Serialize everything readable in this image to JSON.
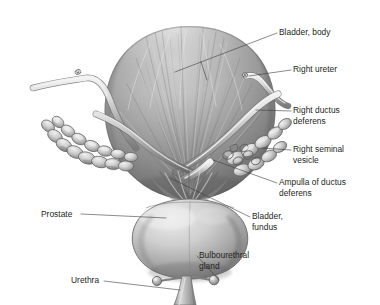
{
  "figure": {
    "background_color": "#ffffff",
    "label_color": "#231f20",
    "leader_color": "#3c3c3c"
  },
  "labels": [
    {
      "id": "bladder-body",
      "lines": [
        "Bladder, body"
      ],
      "x": 279,
      "y": 35,
      "anchor": "start"
    },
    {
      "id": "right-ureter",
      "lines": [
        "Right ureter"
      ],
      "x": 293,
      "y": 72,
      "anchor": "start"
    },
    {
      "id": "right-ductus",
      "lines": [
        "Right ductus",
        "deferens"
      ],
      "x": 293,
      "y": 113,
      "anchor": "start"
    },
    {
      "id": "right-seminal",
      "lines": [
        "Right seminal",
        "vesicle"
      ],
      "x": 293,
      "y": 152,
      "anchor": "start"
    },
    {
      "id": "ampulla-ductus",
      "lines": [
        "Ampulla of ductus",
        "deferens"
      ],
      "x": 279,
      "y": 185,
      "anchor": "start"
    },
    {
      "id": "bladder-fundus",
      "lines": [
        "Bladder,",
        "fundus"
      ],
      "x": 252,
      "y": 219,
      "anchor": "start"
    },
    {
      "id": "bulbourethral-gland",
      "lines": [
        "Bulbourethral",
        "gland"
      ],
      "x": 199,
      "y": 258,
      "anchor": "start"
    },
    {
      "id": "prostate",
      "lines": [
        "Prostate"
      ],
      "x": 41,
      "y": 217,
      "anchor": "start"
    },
    {
      "id": "urethra",
      "lines": [
        "Urethra"
      ],
      "x": 71,
      "y": 283,
      "anchor": "start"
    }
  ],
  "anatomy": {
    "parts": [
      {
        "id": "bladder-body",
        "name": "Bladder, body"
      },
      {
        "id": "bladder-fundus",
        "name": "Bladder, fundus"
      },
      {
        "id": "right-ureter",
        "name": "Right ureter"
      },
      {
        "id": "left-ureter",
        "name": "Left ureter"
      },
      {
        "id": "right-ductus-deferens",
        "name": "Right ductus deferens"
      },
      {
        "id": "left-ductus-deferens",
        "name": "Left ductus deferens"
      },
      {
        "id": "right-seminal-vesicle",
        "name": "Right seminal vesicle"
      },
      {
        "id": "left-seminal-vesicle",
        "name": "Left seminal vesicle"
      },
      {
        "id": "ampulla-of-ductus-deferens",
        "name": "Ampulla of ductus deferens"
      },
      {
        "id": "prostate",
        "name": "Prostate"
      },
      {
        "id": "urethra",
        "name": "Urethra"
      },
      {
        "id": "bulbourethral-gland-left",
        "name": "Bulbourethral gland (left)"
      },
      {
        "id": "bulbourethral-gland-right",
        "name": "Bulbourethral gland (right)"
      }
    ]
  }
}
